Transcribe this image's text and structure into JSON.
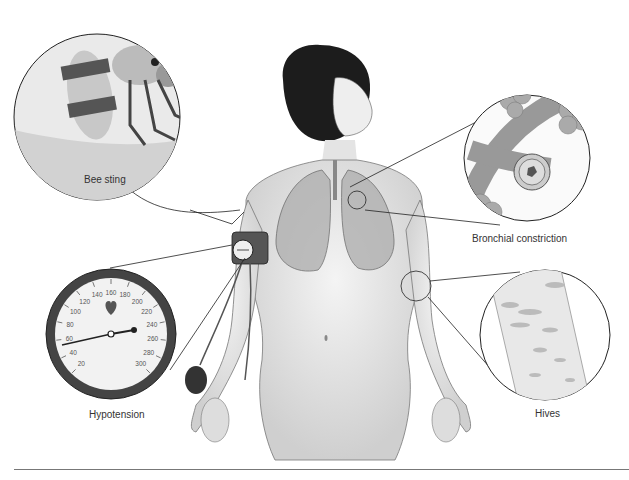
{
  "figure": {
    "labels": {
      "bee_sting": "Bee sting",
      "bronchial": "Bronchial constriction",
      "hypotension": "Hypotension",
      "hives": "Hives"
    },
    "gauge": {
      "ticks": [
        "20",
        "40",
        "60",
        "80",
        "100",
        "120",
        "140",
        "160",
        "180",
        "200",
        "220",
        "240",
        "260",
        "280",
        "300"
      ],
      "needle_reading": "80",
      "icon": "heart-icon"
    },
    "colors": {
      "line": "#222222",
      "skin": "#e6e6e6",
      "hair": "#1a1a1a",
      "lung": "#9a9a9a"
    }
  }
}
